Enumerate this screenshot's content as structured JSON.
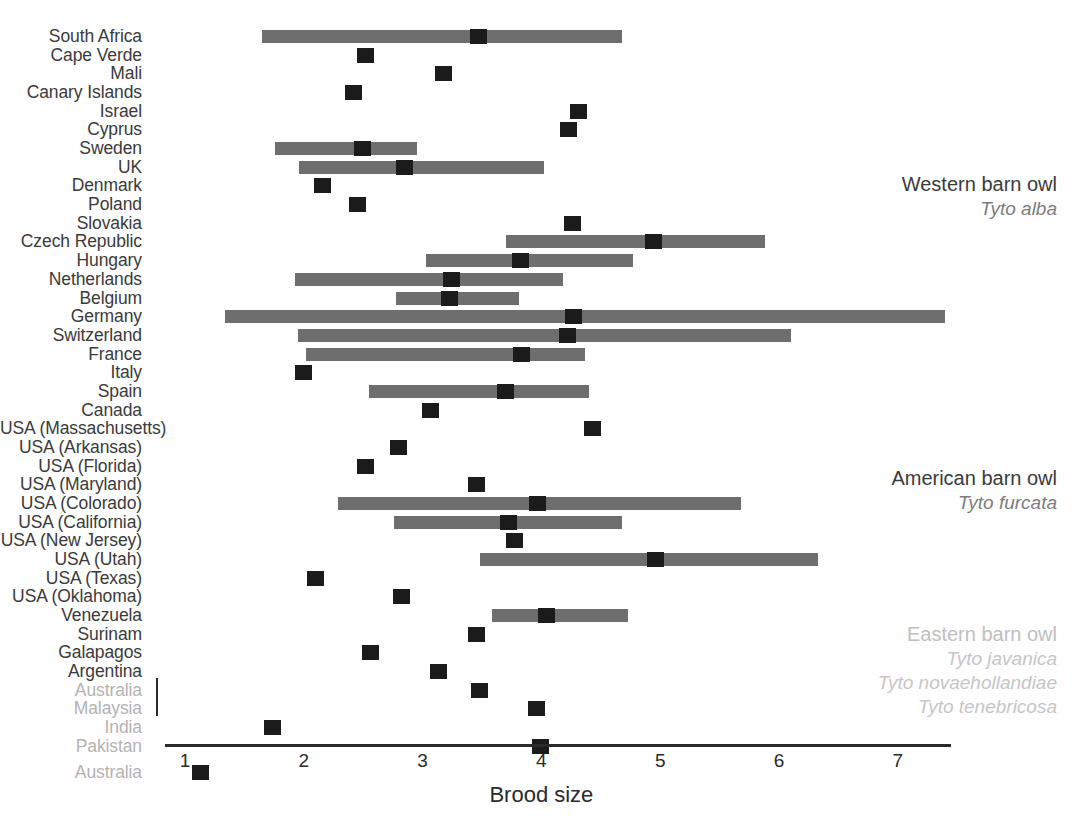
{
  "chart_data": {
    "type": "bar",
    "title": "",
    "xlabel": "Brood size",
    "ylabel": "",
    "xlim": [
      1,
      7.45
    ],
    "xticks": [
      1,
      2,
      3,
      4,
      5,
      6,
      7
    ],
    "xticklabels": [
      "1",
      "2",
      "3",
      "4",
      "5",
      "6",
      "7"
    ],
    "grid": false,
    "legend_position": "right",
    "categories": [
      "South Africa",
      "Cape Verde",
      "Mali",
      "Canary Islands",
      "Israel",
      "Cyprus",
      "Sweden",
      "UK",
      "Denmark",
      "Poland",
      "Slovakia",
      "Czech Republic",
      "Hungary",
      "Netherlands",
      "Belgium",
      "Germany",
      "Switzerland",
      "France",
      "Italy",
      "Spain",
      "Canada",
      "USA (Massachusetts)",
      "USA (Arkansas)",
      "USA (Florida)",
      "USA (Maryland)",
      "USA (Colorado)",
      "USA (California)",
      "USA (New Jersey)",
      "USA (Utah)",
      "USA (Texas)",
      "USA (Oklahoma)",
      "Venezuela",
      "Surinam",
      "Galapagos",
      "Argentina",
      "Australia",
      "Malaysia",
      "India",
      "Pakistan",
      "Australia"
    ],
    "values": [
      3.47,
      2.52,
      3.18,
      2.42,
      4.31,
      4.23,
      2.49,
      2.85,
      2.16,
      2.45,
      4.26,
      4.94,
      3.82,
      3.24,
      3.23,
      4.27,
      4.22,
      3.83,
      2.0,
      3.7,
      3.07,
      4.43,
      2.8,
      2.52,
      3.45,
      3.97,
      3.72,
      3.77,
      4.96,
      2.1,
      2.82,
      4.04,
      3.45,
      2.56,
      3.13,
      3.48,
      3.96,
      1.74,
      3.99,
      1.13
    ],
    "ranges": [
      [
        1.65,
        4.68
      ],
      null,
      null,
      null,
      null,
      null,
      [
        1.76,
        2.95
      ],
      [
        1.96,
        4.02
      ],
      null,
      null,
      null,
      [
        3.7,
        5.88
      ],
      [
        3.03,
        4.77
      ],
      [
        1.93,
        4.18
      ],
      [
        2.78,
        3.81
      ],
      [
        1.34,
        7.4
      ],
      [
        1.95,
        6.1
      ],
      [
        2.02,
        4.37
      ],
      null,
      [
        2.55,
        4.4
      ],
      null,
      null,
      null,
      null,
      null,
      [
        2.29,
        5.68
      ],
      [
        2.76,
        4.68
      ],
      null,
      [
        3.48,
        6.33
      ],
      null,
      null,
      [
        3.58,
        4.73
      ],
      null,
      null,
      null,
      null,
      null,
      null,
      null,
      null
    ],
    "dim_rows": [
      35,
      36,
      37,
      38,
      39
    ],
    "series_colors": {
      "range_bar": "#6e6e6e",
      "mean_marker": "#1b1b1b",
      "axis": "#2b2b2b",
      "label": "#3b3b3b",
      "label_dim": "#b4b4b4"
    },
    "legend": [
      {
        "common_name": "Western barn owl",
        "scientific_names": [
          "Tyto alba"
        ],
        "faded": false
      },
      {
        "common_name": "American barn owl",
        "scientific_names": [
          "Tyto furcata"
        ],
        "faded": false
      },
      {
        "common_name": "Eastern barn owl",
        "scientific_names": [
          "Tyto javanica",
          "Tyto novaehollandiae",
          "Tyto tenebricosa"
        ],
        "faded": true
      }
    ]
  }
}
